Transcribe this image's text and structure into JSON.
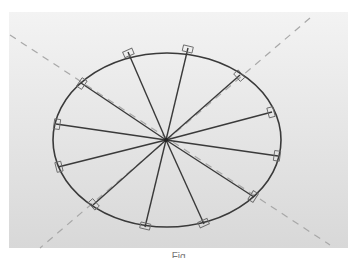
{
  "diagram": {
    "type": "ellipse-with-radial-spokes",
    "ellipse": {
      "cx": 167,
      "cy": 140,
      "rx": 114,
      "ry": 87,
      "stroke": "#3a3a3a"
    },
    "hub": {
      "x": 166,
      "y": 140
    },
    "spoke_color": "#3a3a3a",
    "marker_color": "#6a6a6a",
    "guide_color": "#a8a8a8",
    "spokes": [
      {
        "x": 128,
        "y": 52
      },
      {
        "x": 188,
        "y": 48
      },
      {
        "x": 240,
        "y": 75
      },
      {
        "x": 272,
        "y": 112
      },
      {
        "x": 278,
        "y": 156
      },
      {
        "x": 254,
        "y": 197
      },
      {
        "x": 204,
        "y": 224
      },
      {
        "x": 145,
        "y": 227
      },
      {
        "x": 93,
        "y": 205
      },
      {
        "x": 58,
        "y": 167
      },
      {
        "x": 56,
        "y": 124
      },
      {
        "x": 81,
        "y": 83
      }
    ],
    "guides": [
      {
        "x1": 10,
        "y1": 35,
        "x2": 330,
        "y2": 245
      },
      {
        "x1": 310,
        "y1": 18,
        "x2": 40,
        "y2": 248
      }
    ],
    "caption": "Fig."
  }
}
